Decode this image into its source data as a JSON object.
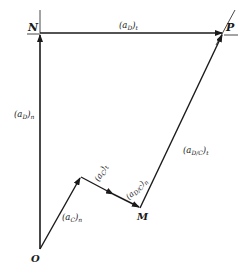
{
  "figure": {
    "type": "acceleration polygon",
    "points": {
      "O": {
        "label": "O",
        "x": 40,
        "y": 249
      },
      "N": {
        "label": "N",
        "x": 40,
        "y": 33
      },
      "P": {
        "label": "P",
        "x": 223,
        "y": 33
      },
      "C": {
        "label": "",
        "x": 81,
        "y": 177
      },
      "M": {
        "label": "M",
        "x": 140,
        "y": 208
      }
    },
    "vectors": [
      {
        "id": "aD_n",
        "from": "O",
        "to": "N",
        "label_main": "(a",
        "label_sub": "D",
        "label_tail": ")",
        "label_index": "n"
      },
      {
        "id": "aD_t",
        "from": "N",
        "to": "P",
        "label_main": "(a",
        "label_sub": "D",
        "label_tail": ")",
        "label_index": "t"
      },
      {
        "id": "aC_n",
        "from": "O",
        "to": "C",
        "label_main": "(a",
        "label_sub": "C",
        "label_tail": ")",
        "label_index": "n"
      },
      {
        "id": "aC_t",
        "from": "C",
        "to": "M",
        "label_main": "(a",
        "label_sub": "C",
        "label_tail": ")",
        "label_index": "t"
      },
      {
        "id": "aDC_n",
        "from": "C",
        "to": "M",
        "label_main": "(a",
        "label_sub": "D/C",
        "label_tail": ")",
        "label_index": "n"
      },
      {
        "id": "aDC_t",
        "from": "M",
        "to": "P",
        "label_main": "(a",
        "label_sub": "D/C",
        "label_tail": ")",
        "label_index": "t"
      }
    ],
    "labels": {
      "O": "O",
      "N": "N",
      "P": "P",
      "M": "M",
      "aD_n": "(a",
      "aD_n_sub": "D",
      "aD_n_end": ")",
      "aD_n_idx": "n",
      "aD_t": "(a",
      "aD_t_sub": "D",
      "aD_t_end": ")",
      "aD_t_idx": "t",
      "aC_n": "(a",
      "aC_n_sub": "C",
      "aC_n_end": ")",
      "aC_n_idx": "n",
      "aC_t": "(a",
      "aC_t_sub": "C",
      "aC_t_end": ")",
      "aC_t_idx": "t",
      "aDC_n": "(a",
      "aDC_n_sub": "D/C",
      "aDC_n_end": ")",
      "aDC_n_idx": "n",
      "aDC_t": "(a",
      "aDC_t_sub": "D/C",
      "aDC_t_end": ")",
      "aDC_t_idx": "t"
    },
    "colors": {
      "stroke": "#1a1a1a",
      "background": "#ffffff"
    }
  }
}
